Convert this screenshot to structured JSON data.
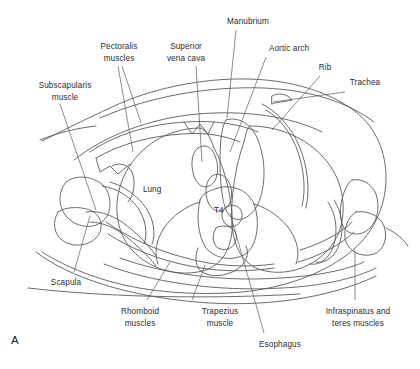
{
  "figure": {
    "panel_letter": "A",
    "kind": "axial cross-section line drawing",
    "level": "T4"
  },
  "inner_labels": [
    {
      "id": "lung",
      "text": "Lung",
      "x": 143,
      "y": 185
    },
    {
      "id": "t4-vertebra",
      "text": "T4",
      "x": 214,
      "y": 206
    }
  ],
  "callouts": [
    {
      "id": "subscapularis-muscle",
      "line1": "Subscapularis",
      "line2": "muscle",
      "x": 22,
      "y": 80,
      "width": 86,
      "align": "center"
    },
    {
      "id": "pectoralis-muscles",
      "line1": "Pectoralis",
      "line2": "muscles",
      "x": 88,
      "y": 41,
      "width": 62,
      "align": "center"
    },
    {
      "id": "superior-vena-cava",
      "line1": "Superior",
      "line2": "vena cava",
      "x": 155,
      "y": 41,
      "width": 62,
      "align": "center"
    },
    {
      "id": "manubrium",
      "line1": "Manubrium",
      "line2": "",
      "x": 216,
      "y": 16,
      "width": 64,
      "align": "center"
    },
    {
      "id": "aortic-arch",
      "line1": "Aortic arch",
      "line2": "",
      "x": 258,
      "y": 43,
      "width": 62,
      "align": "center"
    },
    {
      "id": "rib",
      "line1": "Rib",
      "line2": "",
      "x": 313,
      "y": 62,
      "width": 24,
      "align": "center"
    },
    {
      "id": "trachea",
      "line1": "Trachea",
      "line2": "",
      "x": 341,
      "y": 77,
      "width": 48,
      "align": "center"
    },
    {
      "id": "scapula",
      "line1": "Scapula",
      "line2": "",
      "x": 42,
      "y": 277,
      "width": 48,
      "align": "center"
    },
    {
      "id": "rhomboid-muscles",
      "line1": "Rhomboid",
      "line2": "muscles",
      "x": 110,
      "y": 306,
      "width": 60,
      "align": "center"
    },
    {
      "id": "trapezius-muscle",
      "line1": "Trapezius",
      "line2": "muscle",
      "x": 192,
      "y": 306,
      "width": 56,
      "align": "center"
    },
    {
      "id": "esophagus",
      "line1": "Esophagus",
      "line2": "",
      "x": 249,
      "y": 339,
      "width": 62,
      "align": "center"
    },
    {
      "id": "infraspinatus-and-teres-muscles",
      "line1": "Infraspinatus and",
      "line2": "teres muscles",
      "x": 310,
      "y": 306,
      "width": 96,
      "align": "center"
    }
  ],
  "leaders": [
    {
      "id": "leader-subscapularis",
      "for": "subscapularis-muscle",
      "d": "M 60 104 L 96 210"
    },
    {
      "id": "leader-pectoralis-a",
      "for": "pectoralis-muscles",
      "d": "M 118 66 L 133 152"
    },
    {
      "id": "leader-pectoralis-b",
      "for": "pectoralis-muscles",
      "d": "M 122 66 L 141 123"
    },
    {
      "id": "leader-svc",
      "for": "superior-vena-cava",
      "d": "M 196 66 L 202 162"
    },
    {
      "id": "leader-manubrium",
      "for": "manubrium",
      "d": "M 236 30 L 227 118"
    },
    {
      "id": "leader-aortic-arch",
      "for": "aortic-arch",
      "d": "M 266 57 L 230 152"
    },
    {
      "id": "leader-rib",
      "for": "rib",
      "d": "M 320 76 L 272 130"
    },
    {
      "id": "leader-trachea",
      "for": "trachea",
      "d": "M 345 92 L 273 102"
    },
    {
      "id": "leader-scapula",
      "for": "scapula",
      "d": "M 74 272 L 90 216"
    },
    {
      "id": "leader-rhomboid",
      "for": "rhomboid-muscles",
      "d": "M 147 300 L 170 262"
    },
    {
      "id": "leader-trapezius",
      "for": "trapezius-muscle",
      "d": "M 192 300 L 205 265"
    },
    {
      "id": "leader-esophagus",
      "for": "esophagus",
      "d": "M 264 333 L 230 213"
    },
    {
      "id": "leader-infraspinatus",
      "for": "infraspinatus-and-teres-muscles",
      "d": "M 355 300 L 355 250"
    }
  ],
  "anatomy_outlines": [
    {
      "id": "body-wall-outer-left",
      "d": "M 40 140 C 60 132 78 128 96 126"
    },
    {
      "id": "body-wall-outer-right",
      "d": "M 386 228 C 398 234 404 240 408 246"
    },
    {
      "id": "thorax-outer-contour",
      "d": "M 42 141 C 62 131 86 119 112 107 C 150 89 200 78 248 79 C 292 80 330 92 356 112 C 376 128 386 152 386 178 C 386 208 372 236 348 254 C 322 274 284 288 242 292 C 196 296 148 292 112 282 C 80 273 58 262 42 252"
    },
    {
      "id": "chest-wall-inner-anterior",
      "d": "M 74 160 C 104 136 150 118 198 114 C 244 110 290 116 322 132"
    },
    {
      "id": "pectoralis-band",
      "d": "M 90 152 C 116 134 150 124 186 122 C 214 120 240 124 258 132"
    },
    {
      "id": "pectoralis-slab-lower",
      "d": "M 96 158 C 120 144 150 136 182 134 C 206 132 226 136 240 142"
    },
    {
      "id": "pectoralis-edge-left",
      "d": "M 96 158 L 100 172 L 110 166 L 118 174 L 130 164"
    },
    {
      "id": "lung-left-silhouette",
      "d": "M 200 128 C 168 128 140 146 126 172 C 112 198 114 230 132 250 C 150 270 180 278 206 270 C 222 264 230 250 232 232 C 234 206 226 170 214 148 C 210 136 206 130 200 128 Z"
    },
    {
      "id": "lung-right-silhouette",
      "d": "M 250 126 C 286 126 318 144 334 172 C 348 198 346 230 328 250 C 310 270 280 278 256 268 C 240 260 234 244 232 226 C 230 198 236 164 244 142 C 246 132 248 126 250 126 Z"
    },
    {
      "id": "svc-vessel",
      "d": "M 198 148 C 192 152 190 164 194 176 C 198 188 208 190 214 182 C 220 174 218 158 212 150 C 208 145 202 145 198 148 Z"
    },
    {
      "id": "brachiocephalic-fork",
      "d": "M 184 122 L 192 134 L 200 124 L 208 134 L 214 122"
    },
    {
      "id": "aortic-arch-body",
      "d": "M 226 120 C 238 116 252 124 258 140 C 266 160 266 186 258 204 C 250 220 236 224 228 214 C 222 204 220 182 220 160 C 220 140 222 126 226 120 Z"
    },
    {
      "id": "descending-aorta",
      "d": "M 212 176 C 206 180 204 192 208 202 C 212 212 222 214 228 206 C 234 198 232 184 226 178 C 222 174 216 173 212 176 Z"
    },
    {
      "id": "esophagus-oval",
      "d": "M 228 206 C 222 208 220 216 224 222 C 228 228 236 228 240 222 C 244 216 242 208 236 206 C 233 205 230 205 228 206 Z"
    },
    {
      "id": "trachea-lumen",
      "d": "M 272 96 C 278 92 288 94 292 100 C 284 102 276 102 272 104 Z"
    },
    {
      "id": "vertebra-t4-body",
      "d": "M 200 200 C 196 216 198 236 206 248 C 216 260 236 262 248 252 C 258 242 260 220 254 204 C 248 190 232 184 218 188 C 208 191 202 194 200 200 Z"
    },
    {
      "id": "vertebral-canal",
      "d": "M 216 228 C 212 234 212 244 218 248 C 226 252 234 248 236 240 C 238 232 232 226 224 226 C 220 226 217 227 216 228 Z"
    },
    {
      "id": "spinous-process",
      "d": "M 198 248 C 194 258 196 268 202 272 C 212 278 226 276 236 270 C 246 264 250 254 246 246"
    },
    {
      "id": "transverse-process-left",
      "d": "M 200 202 C 186 206 172 216 164 228 C 156 240 154 254 158 264"
    },
    {
      "id": "transverse-process-right",
      "d": "M 254 204 C 268 208 282 218 290 230 C 298 242 300 254 296 264"
    },
    {
      "id": "rib-left-posterior",
      "d": "M 106 222 C 126 236 154 250 186 258 C 214 266 246 268 274 264"
    },
    {
      "id": "rib-left-posterior-2",
      "d": "M 108 234 C 130 248 158 260 190 266 C 218 272 248 272 274 268"
    },
    {
      "id": "rib-right-posterior",
      "d": "M 300 250 C 320 244 340 234 352 222"
    },
    {
      "id": "rib-right-posterior-2",
      "d": "M 298 262 C 320 256 342 244 354 232"
    },
    {
      "id": "rib-anterior-right",
      "d": "M 262 104 C 278 112 292 128 300 148 C 308 168 310 190 306 208"
    },
    {
      "id": "rib-anterior-right-inner",
      "d": "M 266 110 C 280 118 292 134 298 152 C 304 170 306 190 302 206"
    },
    {
      "id": "scapula-blade-left",
      "d": "M 66 182 C 58 192 58 206 66 216 C 76 228 94 230 104 220 C 112 212 112 196 104 186 C 94 176 76 174 66 182 Z"
    },
    {
      "id": "scapula-spine-left",
      "d": "M 58 212 C 52 222 54 234 62 240 C 72 248 88 246 96 238 C 104 230 102 218 94 212 C 84 206 66 206 58 212 Z"
    },
    {
      "id": "scapula-process-left",
      "d": "M 86 212 C 96 210 110 214 122 222 C 136 232 148 244 156 256"
    },
    {
      "id": "scapula-process-left-2",
      "d": "M 90 222 C 102 222 116 228 128 238 C 140 248 150 258 156 266"
    },
    {
      "id": "subscapularis-left-band",
      "d": "M 102 186 C 116 188 130 196 138 208 C 146 220 148 234 144 244"
    },
    {
      "id": "subscapularis-left-band-2",
      "d": "M 110 182 C 124 186 138 196 146 208 C 154 220 156 234 152 244"
    },
    {
      "id": "humerus-left-fragment",
      "d": "M 112 166 C 118 162 128 164 132 172 C 136 182 134 196 128 202"
    },
    {
      "id": "infraspinatus-right",
      "d": "M 352 180 C 362 178 372 184 376 194 C 380 206 378 220 370 228 C 362 236 350 236 344 228 C 338 218 340 200 346 188 C 348 184 350 181 352 180 Z"
    },
    {
      "id": "teres-right",
      "d": "M 356 212 C 368 210 380 216 384 226 C 388 238 384 250 374 254 C 362 258 350 252 346 242 C 342 232 348 216 356 212 Z"
    },
    {
      "id": "right-scapula-blade",
      "d": "M 334 200 C 342 212 344 228 340 242 C 336 256 326 264 316 262"
    },
    {
      "id": "right-scapula-blade-2",
      "d": "M 328 202 C 336 214 338 230 334 244 C 330 258 320 266 310 264"
    },
    {
      "id": "posterior-skin-contour",
      "d": "M 36 252 C 70 278 128 296 196 302 C 264 308 330 298 376 276"
    },
    {
      "id": "trapezius-band",
      "d": "M 104 264 C 150 282 216 292 282 288 C 324 286 356 278 376 268"
    },
    {
      "id": "rhomboid-band",
      "d": "M 120 258 C 164 274 222 282 280 278 C 318 276 346 270 364 262"
    },
    {
      "id": "posterior-fascia-line",
      "d": "M 28 288 C 96 296 196 300 300 294"
    },
    {
      "id": "anterior-upper-skin",
      "d": "M 100 118 C 150 96 210 86 264 88 C 310 90 348 102 374 122"
    }
  ]
}
